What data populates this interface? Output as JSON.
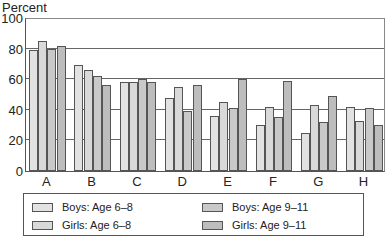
{
  "chart_data": {
    "type": "bar",
    "title": "",
    "ylabel": "Percent",
    "xlabel": "",
    "ylim": [
      0,
      100
    ],
    "yticks": [
      0,
      20,
      40,
      60,
      80,
      100
    ],
    "grid": true,
    "categories": [
      "A",
      "B",
      "C",
      "D",
      "E",
      "F",
      "G",
      "H"
    ],
    "series": [
      {
        "name": "Boys: Age 6–8",
        "color": "#e2e2e2",
        "values": [
          79,
          69,
          58,
          48,
          36,
          30,
          25,
          42
        ]
      },
      {
        "name": "Girls: Age 6–8",
        "color": "#d9d9d9",
        "values": [
          85,
          66,
          58,
          55,
          45,
          42,
          43,
          33
        ]
      },
      {
        "name": "Boys: Age 9–11",
        "color": "#c9c9c9",
        "values": [
          80,
          62,
          60,
          39,
          41,
          35,
          32,
          41
        ]
      },
      {
        "name": "Girls: Age 9–11",
        "color": "#bdbdbd",
        "values": [
          82,
          56,
          58,
          56,
          60,
          59,
          49,
          30
        ]
      }
    ],
    "legend_position": "bottom"
  },
  "legend": {
    "items": [
      "Boys: Age 6–8",
      "Girls: Age 6–8",
      "Boys: Age 9–11",
      "Girls: Age 9–11"
    ]
  }
}
